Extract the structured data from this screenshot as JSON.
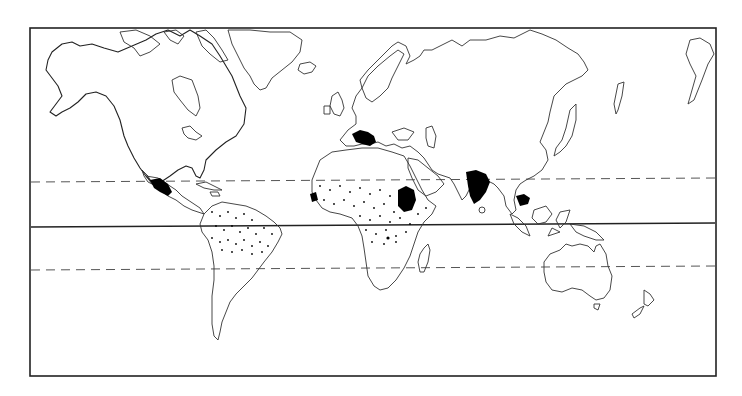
{
  "map": {
    "type": "world-distribution-map",
    "projection": "mercator-like",
    "background": "#ffffff",
    "line_color": "#222222",
    "frame": {
      "x": 30,
      "y": 28,
      "width": 686,
      "height": 348
    },
    "reference_lines": [
      {
        "name": "tropic-of-cancer",
        "style": "dashed",
        "y_left": 182,
        "y_right": 178
      },
      {
        "name": "equator",
        "style": "solid",
        "y_left": 227,
        "y_right": 223
      },
      {
        "name": "tropic-of-capricorn",
        "style": "dashed",
        "y_left": 270,
        "y_right": 266
      }
    ],
    "distribution": {
      "dense_areas": [
        "Mexico / Central America",
        "Western Mediterranean / North Africa coast",
        "West Africa coast (Senegal/Guinea)",
        "Ethiopian highlands / Sudan",
        "India",
        "Indochina"
      ],
      "sparse_areas": [
        "Northern South America / Amazon",
        "Sub-Saharan Africa (Sahel to Central Africa)"
      ]
    }
  }
}
